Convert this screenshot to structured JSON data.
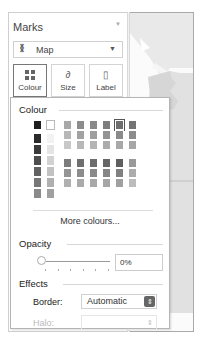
{
  "marks": {
    "title": "Marks",
    "menu_icon": "dropdown-caret",
    "mark_type": {
      "icon": "map-icon",
      "glyph": "⁑",
      "label": "Map",
      "caret": "▼"
    },
    "cards": [
      {
        "id": "colour",
        "label": "Colour",
        "icon": "colour-dots-icon",
        "active": true
      },
      {
        "id": "size",
        "label": "Size",
        "icon": "size-icon",
        "glyph": "∂"
      },
      {
        "id": "label",
        "label": "Label",
        "icon": "label-icon",
        "glyph": "▯"
      }
    ]
  },
  "popup": {
    "colour_heading": "Colour",
    "more_colours": "More colours...",
    "opacity_heading": "Opacity",
    "opacity_value": "0%",
    "effects_heading": "Effects",
    "border_label": "Border:",
    "border_value": "Automatic",
    "halo_label": "Halo:",
    "halo_value": "",
    "select_arrows": "⇕"
  },
  "palette": {
    "top_row": [
      "#1e1e1e",
      "#ffffff"
    ],
    "columns": [
      [
        "#2a2a2a",
        "#3a3a3a",
        "#4e4e4e",
        "#626262",
        "#777777",
        "#8a8a8a"
      ],
      [
        "#f2f2f2",
        "#e4e4e4",
        "#d2d2d2",
        "#c2c2c2",
        "#b0b0b0",
        "#a0a0a0"
      ]
    ],
    "grid_top": [
      [
        "#a8a8a8",
        "#b8b8b8",
        "#c8c8c8"
      ],
      [
        "#8c8c8c",
        "#a2a2a2",
        "#b8b8b8"
      ],
      [
        "#8a8a8a",
        "#9e9e9e",
        "#b4b4b4"
      ],
      [
        "#7e7e7e",
        "#949494",
        "#acacac"
      ],
      [
        "#6e6e6e",
        "#8a8a8a",
        "#a8a8a8"
      ],
      [
        "#747474",
        "#8c8c8c",
        "#a6a6a6"
      ]
    ],
    "grid_bottom": [
      [
        "#7c7c7c",
        "#959595",
        "#b0b0b0"
      ],
      [
        "#6e6e6e",
        "#8c8c8c",
        "#aaaaaa"
      ],
      [
        "#6c6c6c",
        "#8a8a8a",
        "#a8a8a8"
      ],
      [
        "#666666",
        "#868686",
        "#a6a6a6"
      ],
      [
        "#5e5e5e",
        "#808080",
        "#a0a0a0"
      ],
      [
        "#9a9a9a",
        "#acacac",
        "#bcbcbc"
      ]
    ],
    "selected_column": 4
  }
}
